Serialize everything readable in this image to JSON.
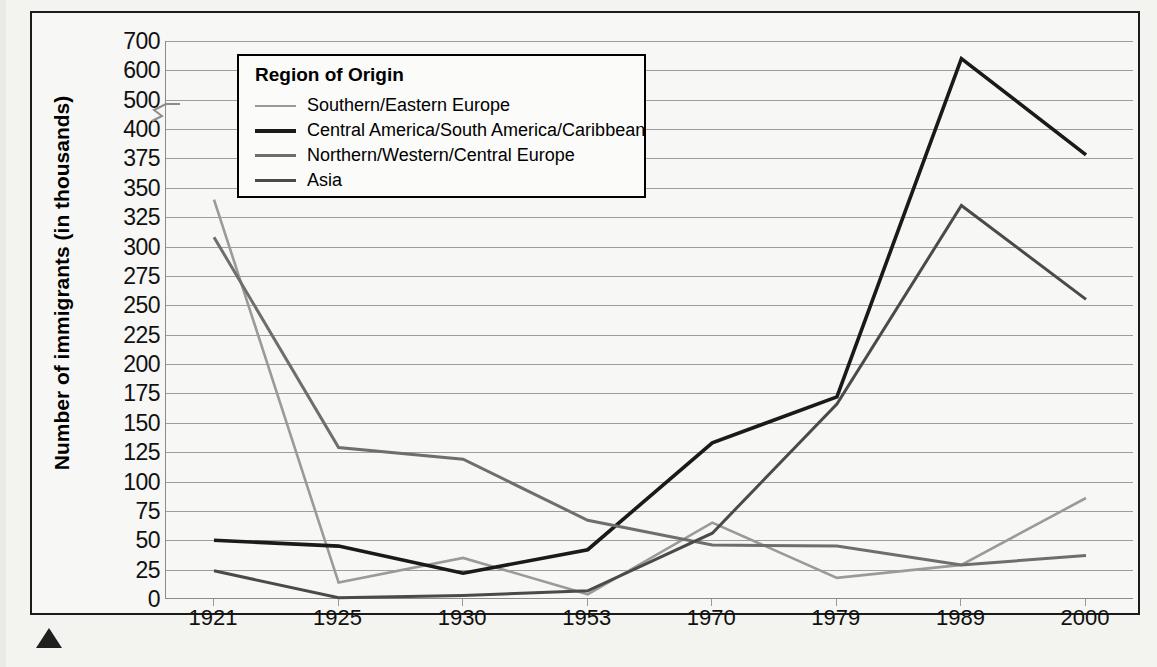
{
  "chart_data": {
    "type": "line",
    "title": "",
    "xlabel": "",
    "ylabel": "Number of immigrants (in thousands)",
    "legend_title": "Region of Origin",
    "legend_position": "top-left-inside",
    "grid": true,
    "axis_break": {
      "between": [
        400,
        500
      ],
      "note": "y-axis broken between 400 and 500"
    },
    "categories": [
      "1921",
      "1925",
      "1930",
      "1953",
      "1970",
      "1979",
      "1989",
      "2000"
    ],
    "ytick_labels": [
      "700",
      "600",
      "500",
      "400",
      "375",
      "350",
      "325",
      "300",
      "275",
      "250",
      "225",
      "200",
      "175",
      "150",
      "125",
      "100",
      "75",
      "50",
      "25",
      "0"
    ],
    "ylim": [
      0,
      700
    ],
    "series": [
      {
        "name": "Southern/Eastern Europe",
        "color": "#9a9a9a",
        "values": [
          340,
          14,
          35,
          4,
          65,
          18,
          29,
          86
        ]
      },
      {
        "name": "Central America/South America/Caribbean",
        "color": "#1a1a1a",
        "values": [
          50,
          45,
          22,
          42,
          133,
          172,
          640,
          378
        ]
      },
      {
        "name": "Northern/Western/Central Europe",
        "color": "#6e6e6e",
        "values": [
          308,
          129,
          119,
          67,
          46,
          45,
          29,
          37
        ]
      },
      {
        "name": "Asia",
        "color": "#4a4a4a",
        "values": [
          24,
          1,
          3,
          7,
          56,
          166,
          335,
          255
        ]
      }
    ]
  }
}
